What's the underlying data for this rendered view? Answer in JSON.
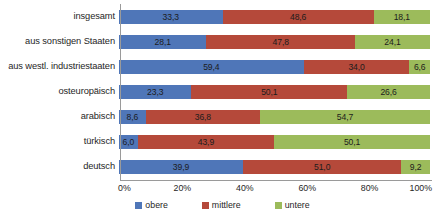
{
  "chart_data": {
    "type": "bar",
    "subtype": "stacked-horizontal-100-percent",
    "title": "",
    "subtitle": "",
    "xlabel": "",
    "ylabel": "",
    "xlim": [
      0,
      100
    ],
    "xticks": [
      "0%",
      "20%",
      "40%",
      "60%",
      "80%",
      "100%"
    ],
    "xtick_values": [
      0,
      20,
      40,
      60,
      80,
      100
    ],
    "grid": false,
    "legend_position": "bottom",
    "categories": [
      "insgesamt",
      "aus sonstigen Staaten",
      "aus westl. industriestaaten",
      "osteuropäisch",
      "arabisch",
      "türkisch",
      "deutsch"
    ],
    "series": [
      {
        "name": "obere",
        "color": "#4f76b8",
        "values": [
          33.3,
          28.1,
          59.4,
          23.3,
          8.6,
          6.0,
          39.9
        ],
        "labels": [
          "33,3",
          "28,1",
          "59,4",
          "23,3",
          "8,6",
          "6,0",
          "39,9"
        ]
      },
      {
        "name": "mittlere",
        "color": "#b5493a",
        "values": [
          48.6,
          47.8,
          34.0,
          50.1,
          36.8,
          43.9,
          51.0
        ],
        "labels": [
          "48,6",
          "47,8",
          "34,0",
          "50,1",
          "36,8",
          "43,9",
          "51,0"
        ]
      },
      {
        "name": "untere",
        "color": "#9cbb5b",
        "values": [
          18.1,
          24.1,
          6.6,
          26.6,
          54.7,
          50.1,
          9.2
        ],
        "labels": [
          "18,1",
          "24,1",
          "6,6",
          "26,6",
          "54,7",
          "50,1",
          "9,2"
        ]
      }
    ]
  },
  "legend": {
    "items": [
      {
        "label": "obere",
        "color": "#4f76b8"
      },
      {
        "label": "mittlere",
        "color": "#b5493a"
      },
      {
        "label": "untere",
        "color": "#9cbb5b"
      }
    ]
  }
}
